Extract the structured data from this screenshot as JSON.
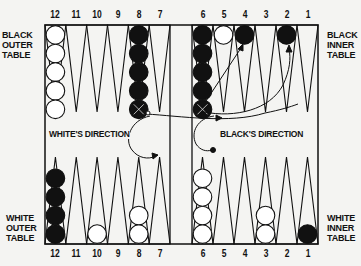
{
  "diagram": {
    "type": "backgammon-board-starting-position",
    "table_labels": {
      "black_outer": "BLACK\nOUTER\nTABLE",
      "black_inner": "BLACK\nINNER\nTABLE",
      "white_outer": "WHITE\nOUTER\nTABLE",
      "white_inner": "WHITE\nINNER\nTABLE"
    },
    "top_point_numbers": [
      "12",
      "11",
      "10",
      "9",
      "8",
      "7",
      "6",
      "5",
      "4",
      "3",
      "2",
      "1"
    ],
    "bottom_point_numbers": [
      "12",
      "11",
      "10",
      "9",
      "8",
      "7",
      "6",
      "5",
      "4",
      "3",
      "2",
      "1"
    ],
    "direction_labels": {
      "white": "WHITE'S DIRECTION",
      "black": "BLACK'S DIRECTION"
    },
    "top_row_checkers": [
      {
        "point": "12",
        "color": "white",
        "count": 5
      },
      {
        "point": "8",
        "color": "black",
        "count": 5
      },
      {
        "point": "6",
        "color": "black",
        "count": 5
      },
      {
        "point": "5",
        "color": "white",
        "count": 1
      },
      {
        "point": "4",
        "color": "black",
        "count": 1
      },
      {
        "point": "2",
        "color": "black",
        "count": 1
      }
    ],
    "bottom_row_checkers": [
      {
        "point": "12",
        "color": "black",
        "count": 4
      },
      {
        "point": "10",
        "color": "white",
        "count": 1
      },
      {
        "point": "8",
        "color": "white",
        "count": 2
      },
      {
        "point": "6",
        "color": "white",
        "count": 4
      },
      {
        "point": "3",
        "color": "white",
        "count": 2
      },
      {
        "point": "1",
        "color": "black",
        "count": 1
      }
    ],
    "colors": {
      "background": "#f4f4f2",
      "ink": "#111111",
      "white_checker": "#ffffff",
      "black_checker": "#111111"
    }
  }
}
